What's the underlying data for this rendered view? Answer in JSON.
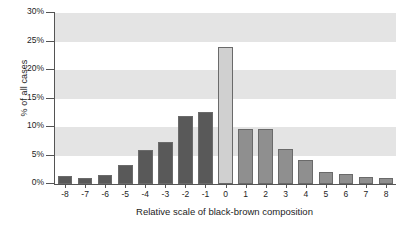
{
  "chart_data": {
    "type": "bar",
    "title": "",
    "xlabel": "Relative scale of black-brown composition",
    "ylabel": "% of all cases",
    "categories": [
      "-8",
      "-7",
      "-6",
      "-5",
      "-4",
      "-3",
      "-2",
      "-1",
      "0",
      "1",
      "2",
      "3",
      "4",
      "5",
      "6",
      "7",
      "8"
    ],
    "values": [
      1.4,
      1.1,
      1.6,
      3.3,
      5.9,
      7.3,
      12.0,
      12.6,
      24.0,
      9.6,
      9.6,
      6.2,
      4.2,
      2.1,
      1.7,
      1.2,
      1.1
    ],
    "bar_colors": [
      "#595959",
      "#595959",
      "#595959",
      "#595959",
      "#595959",
      "#595959",
      "#595959",
      "#595959",
      "#d0d0d0",
      "#8f8f8f",
      "#8f8f8f",
      "#8f8f8f",
      "#8f8f8f",
      "#8f8f8f",
      "#8f8f8f",
      "#8f8f8f",
      "#8f8f8f"
    ],
    "ylim": [
      0,
      30
    ],
    "ytick_values": [
      0,
      5,
      10,
      15,
      20,
      25,
      30
    ],
    "ytick_labels": [
      "0%",
      "5%",
      "10%",
      "15%",
      "20%",
      "25%",
      "30%"
    ],
    "grid": false,
    "banded_background": true,
    "band_ranges": [
      [
        5,
        10
      ],
      [
        15,
        20
      ],
      [
        25,
        30
      ]
    ],
    "band_color": "#e4e4e4",
    "legend": null,
    "series": [
      {
        "name": "% of all cases",
        "values": [
          1.4,
          1.1,
          1.6,
          3.3,
          5.9,
          7.3,
          12.0,
          12.6,
          24.0,
          9.6,
          9.6,
          6.2,
          4.2,
          2.1,
          1.7,
          1.2,
          1.1
        ]
      }
    ]
  },
  "axes": {
    "y_title": "% of all cases",
    "x_title": "Relative scale of black-brown composition"
  },
  "colors": {
    "negative_bar": "#595959",
    "zero_bar": "#d0d0d0",
    "positive_bar": "#8f8f8f",
    "band": "#e4e4e4",
    "axis": "#545454",
    "text": "#1d1d1d"
  }
}
